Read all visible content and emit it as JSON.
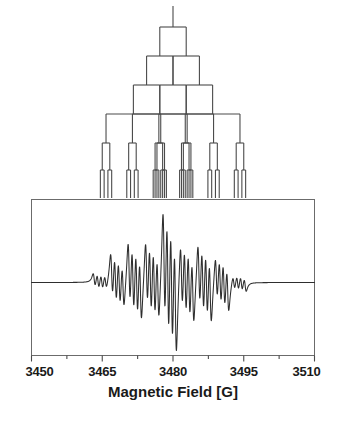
{
  "figure": {
    "title": "",
    "background_color": "#ffffff",
    "line_color": "#3a3a3a",
    "text_color": "#1a1a1a"
  },
  "chart_data": {
    "type": "line",
    "title": "",
    "subtitle": "",
    "xlabel": "Magnetic Field [G]",
    "ylabel": "",
    "xlim": [
      3450,
      3510
    ],
    "ylim": [
      -1.15,
      1.15
    ],
    "grid": false,
    "legend": null,
    "xticks": [
      3450,
      3465,
      3480,
      3495,
      3510
    ],
    "xticklabels": [
      "3450",
      "3465",
      "3480",
      "3495",
      "3510"
    ],
    "minor_xticks": [
      3457.5,
      3472.5,
      3487.5,
      3502.5
    ],
    "yticks": [],
    "yticklabels": [],
    "annotations": [],
    "series": [
      {
        "name": "EPR first-derivative signal",
        "type": "derivative-spectrum",
        "baseline": 0,
        "lorentzian_linewidth_G": 0.42,
        "lines": [
          {
            "center": 3463.3,
            "amplitude": 0.1
          },
          {
            "center": 3464.1,
            "amplitude": 0.11
          },
          {
            "center": 3464.9,
            "amplitude": 0.11
          },
          {
            "center": 3465.7,
            "amplitude": 0.1
          },
          {
            "center": 3467.0,
            "amplitude": 0.34
          },
          {
            "center": 3467.8,
            "amplitude": 0.38
          },
          {
            "center": 3468.6,
            "amplitude": 0.38
          },
          {
            "center": 3469.4,
            "amplitude": 0.34
          },
          {
            "center": 3470.7,
            "amplitude": 0.5
          },
          {
            "center": 3471.5,
            "amplitude": 0.55
          },
          {
            "center": 3472.3,
            "amplitude": 0.55
          },
          {
            "center": 3473.1,
            "amplitude": 0.5
          },
          {
            "center": 3474.4,
            "amplitude": 0.52
          },
          {
            "center": 3475.2,
            "amplitude": 0.58
          },
          {
            "center": 3476.0,
            "amplitude": 0.58
          },
          {
            "center": 3476.8,
            "amplitude": 0.52
          },
          {
            "center": 3478.1,
            "amplitude": 0.88
          },
          {
            "center": 3478.9,
            "amplitude": 1.0
          },
          {
            "center": 3479.7,
            "amplitude": 1.0
          },
          {
            "center": 3480.5,
            "amplitude": 0.88
          },
          {
            "center": 3481.8,
            "amplitude": 0.52
          },
          {
            "center": 3482.6,
            "amplitude": 0.58
          },
          {
            "center": 3483.4,
            "amplitude": 0.58
          },
          {
            "center": 3484.2,
            "amplitude": 0.52
          },
          {
            "center": 3485.5,
            "amplitude": 0.5
          },
          {
            "center": 3486.3,
            "amplitude": 0.55
          },
          {
            "center": 3487.1,
            "amplitude": 0.55
          },
          {
            "center": 3487.9,
            "amplitude": 0.5
          },
          {
            "center": 3489.2,
            "amplitude": 0.34
          },
          {
            "center": 3490.0,
            "amplitude": 0.38
          },
          {
            "center": 3490.8,
            "amplitude": 0.38
          },
          {
            "center": 3491.6,
            "amplitude": 0.34
          },
          {
            "center": 3492.9,
            "amplitude": 0.1
          },
          {
            "center": 3493.7,
            "amplitude": 0.11
          },
          {
            "center": 3494.5,
            "amplitude": 0.11
          },
          {
            "center": 3495.3,
            "amplitude": 0.1
          }
        ]
      }
    ]
  },
  "stick_diagram": {
    "name": "hyperfine-splitting-tree",
    "stem_center": 3480,
    "levels": [
      {
        "level": 1,
        "splitting_G": 5.6,
        "multiplicity": 2,
        "y_top": 27,
        "y_bottom": 56
      },
      {
        "level": 2,
        "splitting_G": 5.6,
        "multiplicity": 2,
        "y_top": 56,
        "y_bottom": 85
      },
      {
        "level": 3,
        "splitting_G": 5.6,
        "multiplicity": 2,
        "y_top": 85,
        "y_bottom": 114
      },
      {
        "level": 4,
        "splitting_G": 11.6,
        "multiplicity": 2,
        "y_top": 114,
        "y_bottom": 143
      },
      {
        "level": 5,
        "splitting_G": 1.6,
        "multiplicity": 2,
        "y_top": 143,
        "y_bottom": 170
      },
      {
        "level": 6,
        "splitting_G": 0.8,
        "multiplicity": 2,
        "y_top": 170,
        "y_bottom": 198
      }
    ],
    "bottom_line_positions": [
      3468.2,
      3474.0,
      3479.8,
      3485.6,
      3491.4
    ]
  }
}
